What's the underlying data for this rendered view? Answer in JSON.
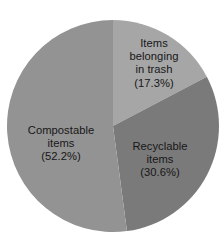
{
  "chart_data": {
    "type": "pie",
    "title": "",
    "categories": [
      "Items belonging in trash",
      "Recyclable items",
      "Compostable items"
    ],
    "values": [
      17.3,
      30.6,
      52.2
    ],
    "value_unit": "%",
    "legend": "none",
    "labels_position": "inside-slice",
    "start_angle_deg": 0,
    "direction": "clockwise",
    "slices": [
      {
        "name": "items-belonging-in-trash",
        "label": "Items\nbelonging\nin trash\n(17.3%)",
        "label_text": "Items belonging in trash",
        "value": 17.3,
        "value_label": "(17.3%)",
        "color": "#a6a6a6",
        "start_deg": 0,
        "end_deg": 62.28
      },
      {
        "name": "recyclable-items",
        "label": "Recyclable\nitems\n(30.6%)",
        "label_text": "Recyclable items",
        "value": 30.6,
        "value_label": "(30.6%)",
        "color": "#7a7a7a",
        "start_deg": 62.28,
        "end_deg": 172.44
      },
      {
        "name": "compostable-items",
        "label": "Compostable\nitems\n(52.2%)",
        "label_text": "Compostable items",
        "value": 52.2,
        "value_label": "(52.2%)",
        "color": "#939393",
        "start_deg": 172.44,
        "end_deg": 360
      }
    ],
    "geometry": {
      "center_x": 113,
      "center_y": 126,
      "radius": 106
    },
    "colors": {
      "background": "#ffffff",
      "text": "#171717",
      "slice_trash": "#a6a6a6",
      "slice_recyclable": "#7a7a7a",
      "slice_compostable": "#939393"
    }
  }
}
